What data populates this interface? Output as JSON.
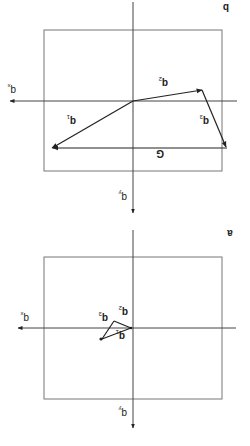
{
  "figure": {
    "rotation_deg": 180,
    "panels": [
      {
        "id": "b",
        "label": "b",
        "axes": {
          "x_label": "q",
          "x_sub": "x",
          "y_label": "q",
          "y_sub": "y"
        },
        "vectors": [
          {
            "name": "q",
            "sub": "1"
          },
          {
            "name": "q",
            "sub": "2"
          },
          {
            "name": "q",
            "sub": "3"
          },
          {
            "name": "G",
            "sub": ""
          }
        ]
      },
      {
        "id": "a",
        "label": "a",
        "axes": {
          "x_label": "q",
          "x_sub": "x",
          "y_label": "q",
          "y_sub": "y"
        },
        "vectors": [
          {
            "name": "q",
            "sub": "1"
          },
          {
            "name": "q",
            "sub": "2"
          },
          {
            "name": "q",
            "sub": "3"
          }
        ]
      }
    ]
  }
}
